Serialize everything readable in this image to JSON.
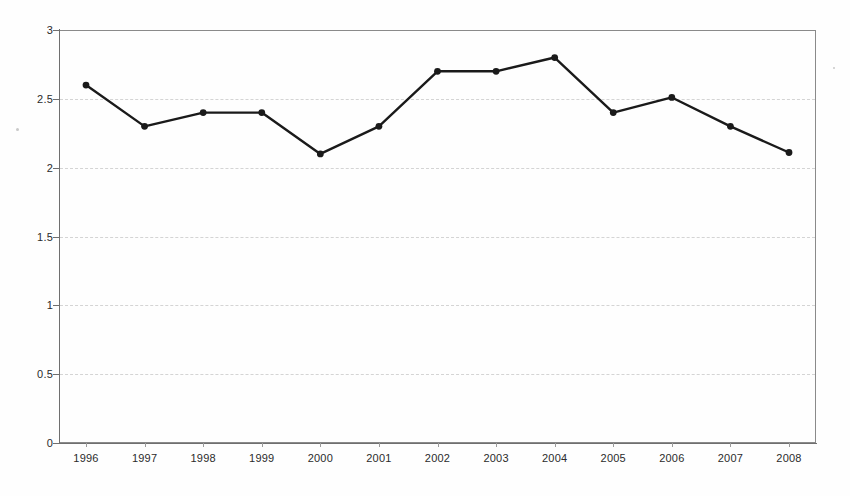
{
  "chart_data": {
    "type": "line",
    "title": "",
    "subtitle": "",
    "xlabel": "",
    "ylabel": "",
    "categories": [
      "1996",
      "1997",
      "1998",
      "1999",
      "2000",
      "2001",
      "2002",
      "2003",
      "2004",
      "2005",
      "2006",
      "2007",
      "2008"
    ],
    "values": [
      2.6,
      2.3,
      2.4,
      2.4,
      2.1,
      2.3,
      2.7,
      2.7,
      2.8,
      2.4,
      2.51,
      2.3,
      2.11
    ],
    "series": [
      {
        "name": "",
        "values": [
          2.6,
          2.3,
          2.4,
          2.4,
          2.1,
          2.3,
          2.7,
          2.7,
          2.8,
          2.4,
          2.51,
          2.3,
          2.11
        ]
      }
    ],
    "ylim": [
      0,
      3
    ],
    "yticks": [
      0,
      0.5,
      1,
      1.5,
      2,
      2.5,
      3
    ],
    "ytick_labels": [
      "0",
      "0.5",
      "1",
      "1.5",
      "2",
      "2.5",
      "3"
    ],
    "grid": true,
    "grid_axis": "y",
    "grid_style": "dashed",
    "legend": false,
    "legend_position": "none",
    "marker": "circle",
    "line_color": "#1a1a1a",
    "marker_color": "#1a1a1a",
    "grid_color": "#d2d2d2",
    "axis_color": "#6f6f6f",
    "background_color": "#ffffff"
  }
}
